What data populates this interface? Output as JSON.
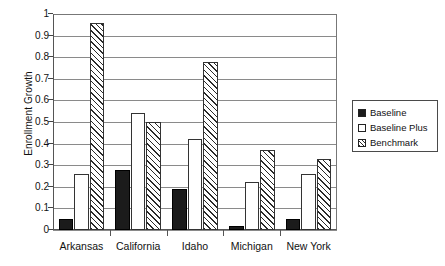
{
  "chart_data": {
    "type": "bar",
    "title": "",
    "subtitle": "",
    "xlabel": "",
    "ylabel": "Enrollment Growth",
    "ylim": [
      0,
      1
    ],
    "ytick_labels": [
      "1",
      "0.9",
      "0.8",
      "0.7",
      "0.6",
      "0.5",
      "0.4",
      "0.3",
      "0.2",
      "0.1",
      "0"
    ],
    "ytick_values": [
      1,
      0.9,
      0.8,
      0.7,
      0.6,
      0.5,
      0.4,
      0.3,
      0.2,
      0.1,
      0
    ],
    "grid": true,
    "grid_axis": "y",
    "legend_position": "right",
    "categories": [
      "Arkansas",
      "California",
      "Idaho",
      "Michigan",
      "New York"
    ],
    "series": [
      {
        "name": "Baseline",
        "fill": "solid-black",
        "color": "#1b1b1b",
        "values": [
          0.05,
          0.28,
          0.19,
          0.02,
          0.05
        ]
      },
      {
        "name": "Baseline Plus",
        "fill": "white",
        "color": "#ffffff",
        "values": [
          0.26,
          0.54,
          0.42,
          0.22,
          0.26
        ]
      },
      {
        "name": "Benchmark",
        "fill": "diagonal-hatch",
        "color": "#ffffff",
        "values": [
          0.96,
          0.5,
          0.78,
          0.37,
          0.33
        ]
      }
    ]
  },
  "legend": {
    "items": [
      {
        "label": "Baseline",
        "swatch": "solid-black-swatch"
      },
      {
        "label": "Baseline Plus",
        "swatch": "white-swatch"
      },
      {
        "label": "Benchmark",
        "swatch": "hatched-swatch"
      }
    ]
  }
}
